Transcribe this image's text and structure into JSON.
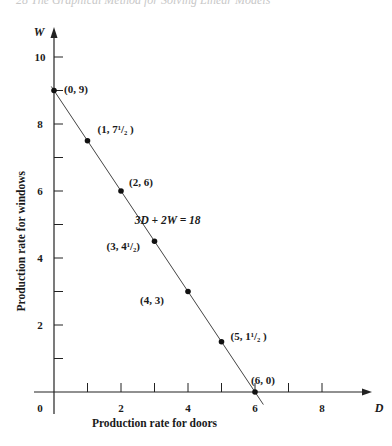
{
  "page": {
    "header": "28   The Graphical Method for Solving Linear Models"
  },
  "chart_data": {
    "type": "line",
    "title": "",
    "xlabel": "Production rate for doors",
    "ylabel": "Production rate for windows",
    "x_axis_symbol": "D",
    "y_axis_symbol": "W",
    "xlim": [
      0,
      9
    ],
    "ylim": [
      0,
      10.5
    ],
    "x_ticks": [
      1,
      2,
      3,
      4,
      5,
      6,
      7,
      8
    ],
    "x_tick_labels": [
      "0",
      "2",
      "4",
      "6",
      "8"
    ],
    "y_ticks": [
      1,
      2,
      3,
      4,
      5,
      6,
      7,
      8,
      9,
      10
    ],
    "y_tick_labels": [
      "2",
      "4",
      "6",
      "8",
      "10"
    ],
    "grid": false,
    "equation_label": "3D + 2W = 18",
    "series": [
      {
        "name": "3D + 2W = 18",
        "x": [
          0,
          1,
          2,
          3,
          4,
          5,
          6
        ],
        "y": [
          9,
          7.5,
          6,
          4.5,
          3,
          1.5,
          0
        ]
      }
    ],
    "point_labels": [
      {
        "x": 0,
        "y": 9,
        "label": "(0, 9)"
      },
      {
        "x": 1,
        "y": 7.5,
        "label": "(1, 7¹/₂ )"
      },
      {
        "x": 2,
        "y": 6,
        "label": "(2, 6)"
      },
      {
        "x": 3,
        "y": 4.5,
        "label": "(3, 4¹/₂)"
      },
      {
        "x": 4,
        "y": 3,
        "label": "(4, 3)"
      },
      {
        "x": 5,
        "y": 1.5,
        "label": "(5, 1¹/₂ )"
      },
      {
        "x": 6,
        "y": 0,
        "label": "(6, 0)"
      }
    ]
  }
}
